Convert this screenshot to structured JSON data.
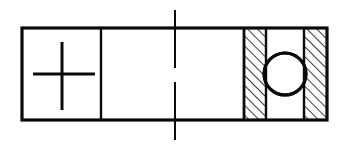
{
  "document": {
    "title": "Bearing Cross-Section Schematic",
    "kind": "engineering-line-drawing",
    "width": 347,
    "height": 150,
    "background_color": "#ffffff",
    "line_color": "#0a0a0a"
  },
  "drawing": {
    "outline": {
      "name": "housing-outline",
      "shape": "rectangle",
      "x": 22,
      "y": 28,
      "width": 305,
      "height": 92,
      "stroke_width": 3.2
    },
    "centerline": {
      "name": "vertical-centerline",
      "style": "dash-dot",
      "x": 175,
      "y_top": 10,
      "y_bottom": 140,
      "stroke_width": 2.0,
      "gap_top": 68,
      "gap_bottom": 82
    },
    "dividers": [
      {
        "name": "divider-left-compartment",
        "x": 101,
        "y_top": 28,
        "y_bottom": 120,
        "stroke_width": 2.4
      },
      {
        "name": "divider-bearing-section",
        "x": 244,
        "y_top": 28,
        "y_bottom": 120,
        "stroke_width": 2.8
      }
    ],
    "cross_symbol": {
      "name": "center-cross-mark",
      "center_x": 62,
      "center_y": 74,
      "arm_left": 33,
      "arm_right": 95,
      "arm_top": 42,
      "arm_bottom": 110,
      "stroke_width": 3.0
    },
    "hatched_bands": [
      {
        "name": "inner-race-hatch",
        "x": 245,
        "y": 29,
        "width": 21,
        "height": 90,
        "hatch_angle_deg": 45,
        "hatch_spacing": 7,
        "stroke_width": 1.6
      },
      {
        "name": "outer-race-hatch",
        "x": 305,
        "y": 29,
        "width": 21,
        "height": 90,
        "hatch_angle_deg": 45,
        "hatch_spacing": 7,
        "stroke_width": 1.6
      }
    ],
    "band_edges": [
      {
        "name": "inner-race-right-edge",
        "x": 266,
        "y_top": 28,
        "y_bottom": 120,
        "stroke_width": 2.4
      },
      {
        "name": "outer-race-left-edge",
        "x": 304,
        "y_top": 28,
        "y_bottom": 120,
        "stroke_width": 2.4
      }
    ],
    "ball": {
      "name": "bearing-ball-circle",
      "center_x": 285,
      "center_y": 74,
      "radius": 21,
      "stroke_width": 3.0,
      "fill": "#ffffff"
    }
  }
}
